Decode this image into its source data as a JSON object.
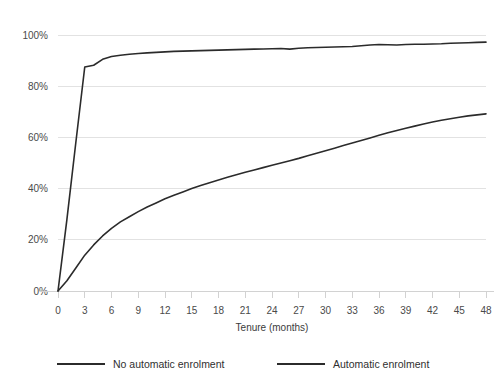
{
  "chart_data": {
    "type": "line",
    "title": "",
    "subtitle": "",
    "xlabel": "Tenure (months)",
    "ylabel": "",
    "xlim": [
      0,
      48
    ],
    "ylim": [
      0,
      100
    ],
    "grid": true,
    "legend_position": "bottom",
    "x": [
      0,
      1,
      2,
      3,
      4,
      5,
      6,
      7,
      8,
      9,
      10,
      11,
      12,
      13,
      14,
      15,
      16,
      17,
      18,
      19,
      20,
      21,
      22,
      23,
      24,
      25,
      26,
      27,
      28,
      29,
      30,
      31,
      32,
      33,
      34,
      35,
      36,
      37,
      38,
      39,
      40,
      41,
      42,
      43,
      44,
      45,
      46,
      47,
      48
    ],
    "x_tick_labels": [
      "0",
      "3",
      "6",
      "9",
      "12",
      "15",
      "18",
      "21",
      "24",
      "27",
      "30",
      "33",
      "36",
      "39",
      "42",
      "45",
      "48"
    ],
    "x_ticks": [
      0,
      3,
      6,
      9,
      12,
      15,
      18,
      21,
      24,
      27,
      30,
      33,
      36,
      39,
      42,
      45,
      48
    ],
    "y_tick_labels": [
      "0%",
      "20%",
      "40%",
      "60%",
      "80%",
      "100%"
    ],
    "y_ticks": [
      0,
      20,
      40,
      60,
      80,
      100
    ],
    "series": [
      {
        "name": "No automatic enrolment",
        "color": "#2b2b2b",
        "values": [
          0,
          4,
          9,
          14,
          18,
          21.5,
          24.5,
          27,
          29,
          31,
          32.8,
          34.4,
          36,
          37.4,
          38.7,
          40,
          41.2,
          42.3,
          43.4,
          44.4,
          45.4,
          46.4,
          47.3,
          48.2,
          49.1,
          50,
          50.9,
          51.8,
          52.8,
          53.8,
          54.8,
          55.8,
          56.8,
          57.8,
          58.8,
          59.8,
          60.8,
          61.8,
          62.7,
          63.6,
          64.4,
          65.2,
          66,
          66.7,
          67.3,
          67.9,
          68.4,
          68.8,
          69.2
        ]
      },
      {
        "name": "Automatic enrolment",
        "color": "#2b2b2b",
        "values": [
          0,
          28,
          58,
          87.5,
          88.2,
          90.5,
          91.6,
          92.1,
          92.5,
          92.8,
          93.0,
          93.2,
          93.4,
          93.6,
          93.7,
          93.8,
          93.9,
          94.0,
          94.1,
          94.2,
          94.3,
          94.4,
          94.5,
          94.55,
          94.6,
          94.7,
          94.5,
          94.8,
          95.0,
          95.1,
          95.2,
          95.3,
          95.4,
          95.5,
          95.8,
          96.1,
          96.3,
          96.2,
          96.1,
          96.3,
          96.4,
          96.4,
          96.5,
          96.6,
          96.8,
          96.9,
          97.0,
          97.1,
          97.2
        ]
      }
    ]
  },
  "legend": {
    "items": [
      {
        "label": "No automatic enrolment"
      },
      {
        "label": "Automatic enrolment"
      }
    ]
  }
}
